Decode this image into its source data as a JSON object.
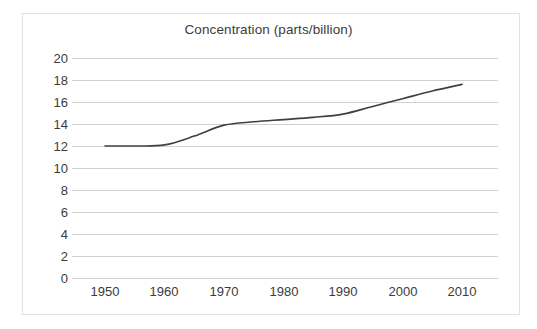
{
  "chart_data": {
    "type": "line",
    "title": "Concentration (parts/billion)",
    "xlabel": "",
    "ylabel": "",
    "xlim": [
      1950,
      2010
    ],
    "ylim": [
      0,
      20
    ],
    "grid": true,
    "legend": "none",
    "x_tick_labels": [
      "1950",
      "1960",
      "1970",
      "1980",
      "1990",
      "2000",
      "2010"
    ],
    "y_tick_labels": [
      "20",
      "18",
      "16",
      "14",
      "12",
      "10",
      "8",
      "6",
      "4",
      "2",
      "0"
    ],
    "x_ticks": [
      1950,
      1960,
      1970,
      1980,
      1990,
      2000,
      2010
    ],
    "y_ticks": [
      20,
      18,
      16,
      14,
      12,
      10,
      8,
      6,
      4,
      2,
      0
    ],
    "series": [
      {
        "name": "Concentration",
        "color": "#404040",
        "x": [
          1950,
          1955,
          1960,
          1965,
          1970,
          1975,
          1980,
          1985,
          1990,
          1995,
          2000,
          2005,
          2010
        ],
        "values": [
          12.0,
          12.0,
          12.1,
          12.9,
          13.9,
          14.2,
          14.4,
          14.6,
          14.9,
          15.6,
          16.3,
          17.0,
          17.6
        ]
      }
    ]
  },
  "styles": {
    "line_color": "#404040",
    "grid_color": "#d0d0d0",
    "text_color": "#3b3b3b",
    "frame_color": "#e2e2e2",
    "background": "#ffffff"
  }
}
